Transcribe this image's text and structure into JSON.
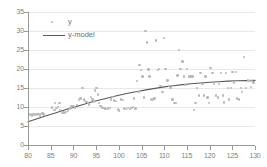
{
  "chart_data": {
    "type": "scatter",
    "title": "",
    "xlabel": "",
    "ylabel": "",
    "xlim": [
      80,
      130
    ],
    "ylim": [
      0,
      35
    ],
    "xticks": [
      80,
      85,
      90,
      95,
      100,
      105,
      110,
      115,
      120,
      125,
      130
    ],
    "yticks": [
      0,
      5,
      10,
      15,
      20,
      25,
      30,
      35
    ],
    "grid": "horizontal",
    "legend_position": "upper-left-inside",
    "colors": {
      "marker": "#b9b9b9",
      "model_line": "#595959",
      "gridline": "#e8e8e8",
      "axis": "#9a9a9a",
      "tick_label": "#808080",
      "legend_label": "#6f6f6f"
    },
    "series": [
      {
        "name": "y",
        "type": "scatter",
        "points": [
          [
            80.2,
            8.1
          ],
          [
            80.4,
            7.9
          ],
          [
            80.6,
            8.2
          ],
          [
            80.9,
            7.8
          ],
          [
            81.1,
            8.0
          ],
          [
            81.3,
            8.2
          ],
          [
            81.6,
            7.9
          ],
          [
            81.8,
            8.1
          ],
          [
            82.0,
            8.0
          ],
          [
            82.3,
            8.2
          ],
          [
            82.6,
            7.8
          ],
          [
            82.9,
            8.1
          ],
          [
            83.2,
            8.3
          ],
          [
            83.5,
            8.0
          ],
          [
            85.3,
            9.9
          ],
          [
            85.8,
            9.2
          ],
          [
            86.0,
            11.0
          ],
          [
            86.3,
            9.7
          ],
          [
            86.6,
            10.0
          ],
          [
            86.9,
            11.0
          ],
          [
            87.1,
            9.2
          ],
          [
            87.5,
            8.5
          ],
          [
            87.8,
            8.6
          ],
          [
            88.1,
            8.5
          ],
          [
            88.4,
            8.7
          ],
          [
            88.8,
            9.0
          ],
          [
            89.2,
            9.6
          ],
          [
            89.6,
            10.1
          ],
          [
            90.0,
            10.3
          ],
          [
            90.4,
            9.9
          ],
          [
            90.8,
            10.5
          ],
          [
            91.2,
            11.8
          ],
          [
            91.6,
            12.2
          ],
          [
            92.0,
            15.0
          ],
          [
            92.3,
            12.0
          ],
          [
            92.6,
            11.6
          ],
          [
            92.9,
            11.3
          ],
          [
            93.2,
            11.0
          ],
          [
            93.5,
            10.7
          ],
          [
            93.9,
            12.7
          ],
          [
            94.2,
            12.0
          ],
          [
            94.5,
            11.4
          ],
          [
            94.8,
            14.3
          ],
          [
            95.1,
            15.0
          ],
          [
            95.4,
            13.3
          ],
          [
            95.7,
            11.0
          ],
          [
            96.0,
            10.2
          ],
          [
            96.3,
            9.9
          ],
          [
            96.6,
            9.8
          ],
          [
            96.9,
            9.6
          ],
          [
            97.2,
            9.4
          ],
          [
            97.6,
            9.6
          ],
          [
            98.0,
            9.8
          ],
          [
            98.3,
            12.0
          ],
          [
            98.7,
            12.6
          ],
          [
            99.0,
            11.7
          ],
          [
            99.4,
            11.6
          ],
          [
            99.8,
            9.3
          ],
          [
            100.1,
            9.1
          ],
          [
            100.5,
            12.0
          ],
          [
            100.9,
            11.8
          ],
          [
            101.2,
            9.6
          ],
          [
            101.6,
            9.4
          ],
          [
            102.0,
            9.7
          ],
          [
            102.4,
            9.5
          ],
          [
            102.8,
            9.8
          ],
          [
            103.1,
            10.0
          ],
          [
            103.4,
            12.2
          ],
          [
            103.7,
            9.6
          ],
          [
            104.0,
            16.8
          ],
          [
            104.3,
            13.9
          ],
          [
            104.6,
            21.0
          ],
          [
            104.9,
            19.8
          ],
          [
            105.2,
            18.0
          ],
          [
            105.6,
            12.5
          ],
          [
            105.9,
            30.0
          ],
          [
            106.2,
            27.0
          ],
          [
            106.5,
            19.9
          ],
          [
            106.8,
            18.0
          ],
          [
            107.1,
            12.0
          ],
          [
            107.5,
            12.0
          ],
          [
            107.9,
            12.2
          ],
          [
            108.2,
            27.5
          ],
          [
            108.6,
            19.8
          ],
          [
            108.9,
            20.0
          ],
          [
            109.2,
            15.6
          ],
          [
            109.6,
            14.0
          ],
          [
            110.0,
            28.2
          ],
          [
            110.3,
            20.0
          ],
          [
            110.7,
            17.0
          ],
          [
            111.0,
            15.6
          ],
          [
            111.4,
            15.0
          ],
          [
            111.8,
            12.0
          ],
          [
            112.1,
            11.0
          ],
          [
            112.5,
            11.0
          ],
          [
            112.9,
            18.3
          ],
          [
            113.2,
            25.0
          ],
          [
            113.6,
            20.0
          ],
          [
            114.0,
            22.0
          ],
          [
            114.3,
            18.0
          ],
          [
            114.7,
            15.8
          ],
          [
            115.0,
            20.0
          ],
          [
            115.4,
            18.0
          ],
          [
            115.7,
            18.0
          ],
          [
            116.0,
            18.0
          ],
          [
            116.3,
            18.0
          ],
          [
            116.6,
            9.2
          ],
          [
            116.9,
            11.0
          ],
          [
            117.2,
            15.0
          ],
          [
            117.6,
            13.0
          ],
          [
            118.0,
            19.0
          ],
          [
            118.4,
            16.0
          ],
          [
            118.8,
            13.0
          ],
          [
            119.1,
            18.0
          ],
          [
            119.5,
            12.5
          ],
          [
            119.9,
            11.0
          ],
          [
            120.2,
            20.2
          ],
          [
            120.6,
            19.0
          ],
          [
            121.0,
            16.0
          ],
          [
            121.4,
            13.0
          ],
          [
            121.8,
            12.5
          ],
          [
            122.1,
            16.0
          ],
          [
            122.5,
            19.0
          ],
          [
            122.9,
            13.0
          ],
          [
            123.2,
            11.2
          ],
          [
            123.6,
            19.0
          ],
          [
            124.0,
            15.0
          ],
          [
            124.3,
            12.0
          ],
          [
            124.7,
            15.0
          ],
          [
            125.0,
            19.2
          ],
          [
            125.4,
            16.5
          ],
          [
            125.8,
            19.2
          ],
          [
            126.1,
            12.2
          ],
          [
            126.5,
            12.0
          ],
          [
            126.9,
            15.0
          ],
          [
            127.2,
            14.0
          ],
          [
            127.6,
            23.2
          ],
          [
            128.0,
            15.0
          ],
          [
            128.4,
            17.0
          ],
          [
            128.8,
            16.8
          ],
          [
            129.1,
            15.2
          ],
          [
            129.4,
            16.8
          ],
          [
            129.7,
            16.5
          ]
        ]
      },
      {
        "name": "y-model",
        "type": "line",
        "x": [
          80,
          82,
          84,
          86,
          88,
          90,
          92,
          94,
          96,
          98,
          100,
          102,
          104,
          106,
          108,
          110,
          112,
          114,
          116,
          118,
          120,
          122,
          124,
          126,
          128,
          130
        ],
        "values": [
          6.1,
          6.9,
          7.7,
          8.4,
          9.2,
          9.9,
          10.6,
          11.3,
          11.9,
          12.5,
          13.1,
          13.6,
          14.1,
          14.5,
          14.9,
          15.3,
          15.6,
          15.9,
          16.1,
          16.3,
          16.5,
          16.65,
          16.8,
          16.9,
          16.95,
          17.0
        ]
      }
    ]
  },
  "legend": {
    "items": [
      {
        "label": "y",
        "marker": "dot"
      },
      {
        "label": "y-model",
        "marker": "line"
      }
    ]
  }
}
